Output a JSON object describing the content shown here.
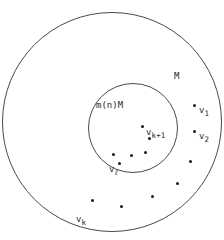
{
  "figure": {
    "name": "nested-circles-point-set-diagram",
    "background_color": "#ffffff",
    "stroke_color": "#4a4a4a",
    "dot_color": "#1a1a1a",
    "text_color": "#2b2b2b",
    "outer_circle": {
      "cx": 112,
      "cy": 122,
      "r": 110
    },
    "inner_circle": {
      "cx": 133,
      "cy": 128,
      "r": 45
    }
  },
  "labels": {
    "outer_region": "M",
    "inner_region": "m(n)M",
    "v1": {
      "base": "v",
      "sub": "1"
    },
    "v2": {
      "base": "v",
      "sub": "2"
    },
    "vk": {
      "base": "v",
      "sub": "k"
    },
    "vk1": {
      "base": "v",
      "sub": "k+1"
    },
    "vl": {
      "base": "v",
      "sub": "ℓ"
    }
  },
  "points": {
    "inner": [
      {
        "x": 142,
        "y": 126
      },
      {
        "x": 149,
        "y": 138
      },
      {
        "x": 145,
        "y": 152
      },
      {
        "x": 131,
        "y": 155
      },
      {
        "x": 113,
        "y": 154
      },
      {
        "x": 119,
        "y": 163
      }
    ],
    "annulus": [
      {
        "x": 194,
        "y": 105
      },
      {
        "x": 194,
        "y": 131
      },
      {
        "x": 190,
        "y": 161
      },
      {
        "x": 177,
        "y": 183
      },
      {
        "x": 152,
        "y": 196
      },
      {
        "x": 121,
        "y": 206
      },
      {
        "x": 92,
        "y": 200
      }
    ]
  }
}
